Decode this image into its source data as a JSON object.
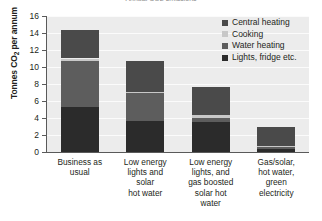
{
  "chart_data": {
    "type": "bar",
    "stacked": true,
    "title": "Annual CO2 emissions",
    "xlabel": "",
    "ylabel": "Tonnes CO2 per annum",
    "ylabel_html": "Tonnes CO<sub>2</sub> per annum",
    "ylim": [
      0,
      16
    ],
    "yticks": [
      0,
      2,
      4,
      6,
      8,
      10,
      12,
      14,
      16
    ],
    "ytick_labels": [
      "0",
      "2",
      "4",
      "6",
      "8",
      "10",
      "12",
      "14",
      "16"
    ],
    "grid": true,
    "legend_position": "top-right",
    "categories": [
      "Business as usual",
      "Low energy lights and solar hot water",
      "Low energy lights, and gas boosted solar hot water",
      "Gas/solar, hot water, green electricity"
    ],
    "category_label_lines": [
      [
        "Business as",
        "usual"
      ],
      [
        "Low energy",
        "lights and",
        "solar",
        "hot water"
      ],
      [
        "Low energy",
        "lights, and",
        "gas boosted",
        "solar hot",
        "water"
      ],
      [
        "Gas/solar,",
        "hot water,",
        "green",
        "electricity"
      ]
    ],
    "series": [
      {
        "name": "Lights, fridge etc.",
        "color": "#2b2b2b",
        "values": [
          5.3,
          3.6,
          3.5,
          0.4
        ]
      },
      {
        "name": "Water heating",
        "color": "#5d5d5d",
        "values": [
          5.4,
          3.3,
          0.5,
          0.2
        ]
      },
      {
        "name": "Cooking",
        "color": "#c8c8c8",
        "values": [
          0.3,
          0.2,
          0.3,
          0.1
        ]
      },
      {
        "name": "Central heating",
        "color": "#4a4a4a",
        "values": [
          3.3,
          3.6,
          3.3,
          2.3
        ]
      }
    ],
    "totals": [
      14.3,
      10.7,
      7.6,
      3.0
    ],
    "legend_order": [
      "Central heating",
      "Cooking",
      "Water heating",
      "Lights, fridge etc."
    ],
    "plot_background": "#ececec",
    "gridline_color": "#fbfbfb",
    "axis_color": "#5a5a5a"
  },
  "legend": {
    "items": [
      {
        "label": "Central heating",
        "color": "#4a4a4a"
      },
      {
        "label": "Cooking",
        "color": "#c8c8c8"
      },
      {
        "label": "Water heating",
        "color": "#5d5d5d"
      },
      {
        "label": "Lights, fridge etc.",
        "color": "#2b2b2b"
      }
    ]
  }
}
